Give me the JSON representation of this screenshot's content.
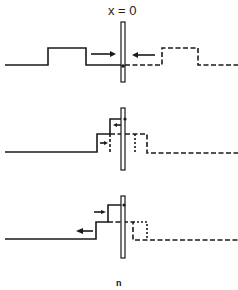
{
  "diagram": {
    "title_label": "x = 0",
    "caption": "n",
    "colors": {
      "stroke": "#1a1a1a",
      "background": "#ffffff"
    },
    "panels": [
      {
        "name": "incident-pulses",
        "description": "Two rectangular pulses approaching barrier at x = 0 from opposite sides (solid left, dashed right)"
      },
      {
        "name": "overlap-stage",
        "description": "Pulses overlapping at the barrier, stepped superposition with arrows"
      },
      {
        "name": "reflected-stage",
        "description": "Resulting pulse moving left after interaction with barrier"
      }
    ]
  }
}
